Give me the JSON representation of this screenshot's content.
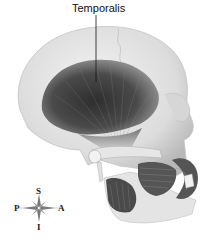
{
  "diagram": {
    "labels": [
      {
        "id": "temporalis",
        "text": "Temporalis"
      }
    ],
    "compass": {
      "superior": "S",
      "posterior": "P",
      "anterior": "A",
      "inferior": "I"
    },
    "colors": {
      "bone": "#e8e8e8",
      "bone_shadow": "#bdbdbd",
      "muscle_dark": "#3a3a3a",
      "muscle_mid": "#6e6e6e",
      "leader_line": "#111111"
    }
  }
}
